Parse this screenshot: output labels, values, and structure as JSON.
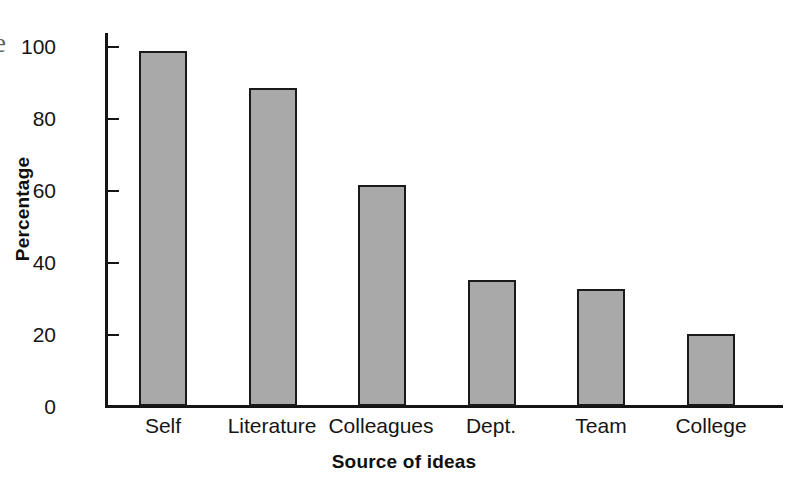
{
  "figure": {
    "page_edge_glyph": "e",
    "background_color": "#ffffff",
    "bar_fill_color": "#a9a9a9",
    "bar_edge_color": "#1a1a1a",
    "axis_color": "#151515"
  },
  "chart_data": {
    "type": "bar",
    "title": "",
    "subtitle": "",
    "xlabel": "Source of ideas",
    "ylabel": "Percentage",
    "categories": [
      "Self",
      "Literature",
      "Colleagues",
      "Dept.",
      "Team",
      "College"
    ],
    "values": [
      98.5,
      88.3,
      61.5,
      35.0,
      32.5,
      20.0
    ],
    "series": [
      {
        "name": "Percentage",
        "values": [
          98.5,
          88.3,
          61.5,
          35.0,
          32.5,
          20.0
        ]
      }
    ],
    "ylim": [
      0,
      105
    ],
    "ytick_values": [
      0,
      20,
      40,
      60,
      80,
      100
    ],
    "ytick_labels": [
      "0",
      "20",
      "40",
      "60",
      "80",
      "100"
    ],
    "grid": false,
    "legend": false,
    "legend_position": "none",
    "annotations": []
  }
}
